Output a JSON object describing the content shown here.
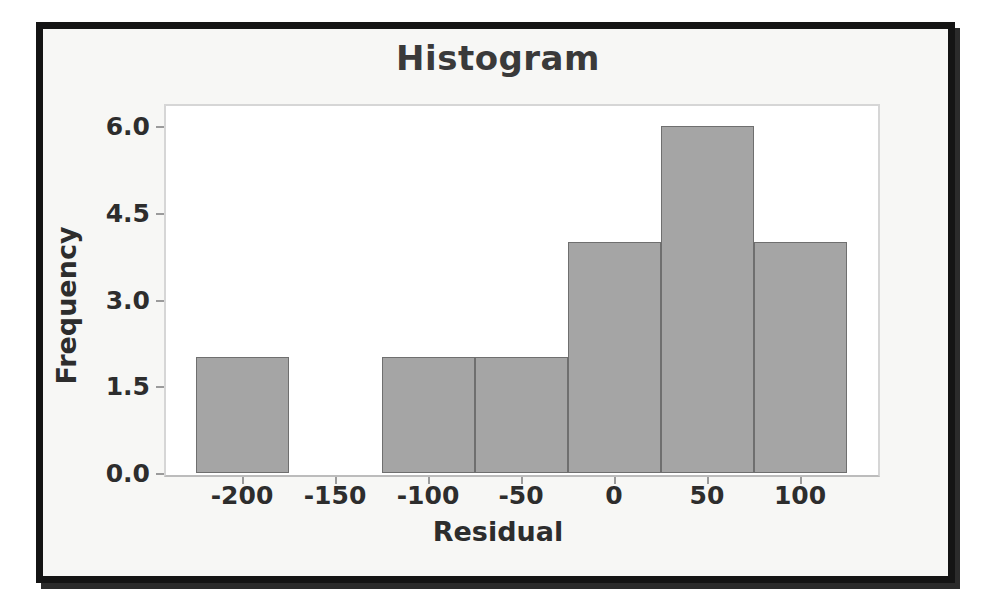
{
  "chart_data": {
    "type": "bar",
    "title": "Histogram",
    "xlabel": "Residual",
    "ylabel": "Frequency",
    "grid": false,
    "legend": null,
    "bin_width": 50,
    "xlim": [
      -235,
      135
    ],
    "ylim": [
      0,
      6.4
    ],
    "xticks": [
      -200,
      -150,
      -100,
      -50,
      0,
      50,
      100
    ],
    "xtick_labels": [
      "-200",
      "-150",
      "-100",
      "-50",
      "0",
      "50",
      "100"
    ],
    "yticks": [
      0.0,
      1.5,
      3.0,
      4.5,
      6.0
    ],
    "ytick_labels": [
      "0.0",
      "1.5",
      "3.0",
      "4.5",
      "6.0"
    ],
    "bins": [
      {
        "left": -225,
        "right": -175,
        "value": 2
      },
      {
        "left": -125,
        "right": -75,
        "value": 2
      },
      {
        "left": -75,
        "right": -25,
        "value": 2
      },
      {
        "left": -25,
        "right": 25,
        "value": 4
      },
      {
        "left": 25,
        "right": 75,
        "value": 6
      },
      {
        "left": 75,
        "right": 125,
        "value": 4
      }
    ],
    "categories": [
      "-225 to -175",
      "-175 to -125",
      "-125 to -75",
      "-75 to -25",
      "-25 to 25",
      "25 to 75",
      "75 to 125"
    ],
    "values": [
      2,
      0,
      2,
      2,
      4,
      6,
      4
    ],
    "colors": {
      "bar_fill": "#a5a5a5",
      "bar_edge": "#6f6f6f",
      "text": "#2d2d2d",
      "title": "#3a3a3a",
      "plot_border": "#d6d6d6",
      "frame": "#141414",
      "background": "#f7f7f5"
    }
  }
}
